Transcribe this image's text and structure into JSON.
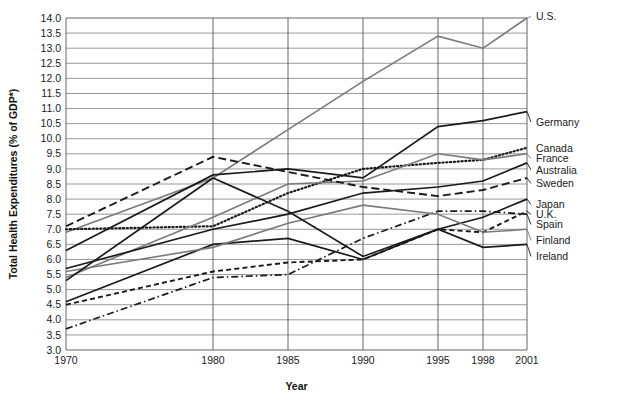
{
  "chart_data": {
    "type": "line",
    "title": "",
    "xlabel": "Year",
    "ylabel": "Total Health Expenditures (% of GDP*)",
    "x": [
      1970,
      1980,
      1985,
      1990,
      1995,
      1998,
      2001
    ],
    "xticklabels": [
      "1970",
      "1980",
      "1985",
      "1990",
      "1995",
      "1998",
      "2001"
    ],
    "ylim": [
      3.0,
      14.0
    ],
    "yticks": [
      3.0,
      3.5,
      4.0,
      4.5,
      5.0,
      5.5,
      6.0,
      6.5,
      7.0,
      7.5,
      8.0,
      8.5,
      9.0,
      9.5,
      10.0,
      10.5,
      11.0,
      11.5,
      12.0,
      12.5,
      13.0,
      13.5,
      14.0
    ],
    "yticklabels": [
      "3.0",
      "3.5",
      "4.0",
      "4.5",
      "5.0",
      "5.5",
      "6.0",
      "6.5",
      "7.0",
      "7.5",
      "8.0",
      "8.5",
      "9.0",
      "9.5",
      "10.0",
      "10.5",
      "11.0",
      "11.5",
      "12.0",
      "12.5",
      "13.0",
      "13.5",
      "14.0"
    ],
    "grid": true,
    "legend_position": "right-of-axes-inline",
    "series": [
      {
        "name": "U.S.",
        "label": "U.S.",
        "values": [
          6.9,
          8.7,
          10.3,
          11.9,
          13.4,
          13.0,
          14.0
        ],
        "style": "solid",
        "color": "#7a7a7a",
        "width": 1.6,
        "label_y": 14.05
      },
      {
        "name": "Germany",
        "label": "Germany",
        "values": [
          6.3,
          8.8,
          9.0,
          8.7,
          10.4,
          10.6,
          10.9
        ],
        "style": "solid",
        "color": "#1a1a1a",
        "width": 1.7,
        "label_y": 10.55
      },
      {
        "name": "Canada",
        "label": "Canada",
        "values": [
          7.0,
          7.1,
          8.2,
          9.0,
          9.2,
          9.3,
          9.7
        ],
        "style": "dotted",
        "color": "#1a1a1a",
        "width": 2.2,
        "label_y": 9.7
      },
      {
        "name": "France",
        "label": "France",
        "values": [
          5.4,
          7.4,
          8.5,
          8.6,
          9.5,
          9.3,
          9.5
        ],
        "style": "solid",
        "color": "#7a7a7a",
        "width": 1.6,
        "label_y": 9.35
      },
      {
        "name": "Australia",
        "label": "Australia",
        "values": [
          5.7,
          7.0,
          7.5,
          8.2,
          8.4,
          8.6,
          9.2
        ],
        "style": "solid",
        "color": "#1a1a1a",
        "width": 1.7,
        "label_y": 8.97
      },
      {
        "name": "Sweden",
        "label": "Sweden",
        "values": [
          7.1,
          9.4,
          8.9,
          8.4,
          8.1,
          8.3,
          8.7
        ],
        "style": "dashed",
        "color": "#1a1a1a",
        "width": 1.9,
        "label_y": 8.52
      },
      {
        "name": "Japan",
        "label": "Japan",
        "values": [
          4.6,
          6.5,
          6.7,
          6.0,
          7.0,
          7.4,
          8.0
        ],
        "style": "solid",
        "color": "#1a1a1a",
        "width": 1.7,
        "label_y": 7.82
      },
      {
        "name": "U.K.",
        "label": "U.K.",
        "values": [
          4.5,
          5.6,
          5.9,
          6.0,
          7.0,
          6.9,
          7.6
        ],
        "style": "dashed2",
        "color": "#1a1a1a",
        "width": 1.9,
        "label_y": 7.49
      },
      {
        "name": "Spain",
        "label": "Spain",
        "values": [
          3.7,
          5.4,
          5.5,
          6.7,
          7.6,
          7.6,
          7.5
        ],
        "style": "dashdot",
        "color": "#1a1a1a",
        "width": 1.7,
        "label_y": 7.16
      },
      {
        "name": "Finland",
        "label": "Finland",
        "values": [
          5.6,
          6.4,
          7.2,
          7.8,
          7.5,
          6.9,
          7.0
        ],
        "style": "solid",
        "color": "#7a7a7a",
        "width": 1.6,
        "label_y": 6.63
      },
      {
        "name": "Ireland",
        "label": "Ireland",
        "values": [
          5.3,
          8.7,
          7.6,
          6.1,
          7.0,
          6.4,
          6.5
        ],
        "style": "solid",
        "color": "#1a1a1a",
        "width": 1.7,
        "label_y": 6.1
      }
    ]
  },
  "axes": {
    "x_title": "Year",
    "y_title": "Total Health Expenditures (% of GDP*)"
  }
}
